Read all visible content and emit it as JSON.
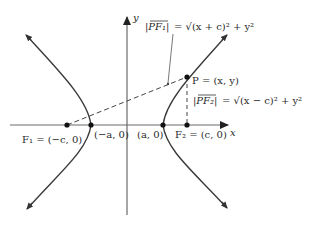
{
  "diagram": {
    "type": "hyperbola",
    "axes": {
      "x_label": "x",
      "y_label": "y"
    },
    "points": {
      "F1": "F₁ = (−c, 0)",
      "neg_vertex": "(−a, 0)",
      "pos_vertex": "(a, 0)",
      "F2": "F₂ = (c, 0)",
      "P": "P = (x, y)"
    },
    "distance_labels": {
      "PF1_lhs": "|PF₁|",
      "PF1_rhs": "= √(x + c)² + y²",
      "PF2_lhs": "|PF₂|",
      "PF2_rhs": "= √(x − c)² + y²"
    },
    "colors": {
      "curve": "#3a3a3a",
      "axis": "#555555",
      "text": "#2a2a2a"
    }
  }
}
